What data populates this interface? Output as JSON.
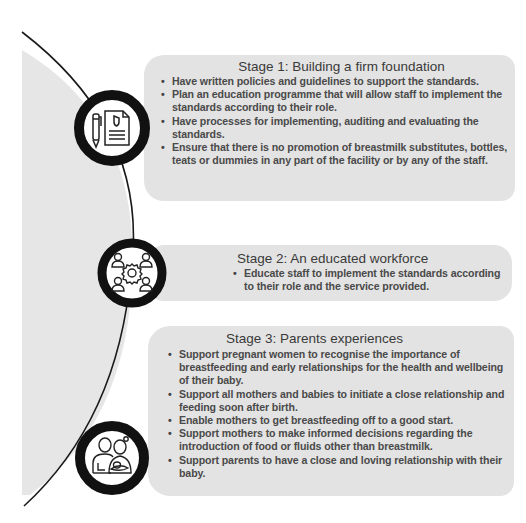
{
  "diagram": {
    "stages": [
      {
        "title": "Stage 1: Building a firm foundation",
        "icon": "document-pen-icon",
        "bullets": [
          "Have written policies and guidelines to support the standards.",
          "Plan an education programme that will allow staff to implement the standards according to their role.",
          "Have processes for implementing, auditing and evaluating the standards.",
          "Ensure that there is no promotion of breastmilk substitutes, bottles, teats or dummies in any part of the facility or by any of the staff."
        ]
      },
      {
        "title": "Stage 2: An educated workforce",
        "icon": "team-gear-icon",
        "bullets": [
          "Educate staff to implement the standards according to their role and the service provided."
        ]
      },
      {
        "title": "Stage 3: Parents experiences",
        "icon": "parents-baby-icon",
        "bullets": [
          "Support pregnant women to recognise the importance of breastfeeding and early relationships for the health and wellbeing of their baby.",
          "Support all mothers and babies to initiate a close relationship and feeding soon after birth.",
          "Enable mothers to get breastfeeding off to a good start.",
          "Support mothers to make informed decisions regarding the introduction of food or fluids other than breastmilk.",
          "Support parents to have a close and loving relationship with their baby."
        ]
      }
    ],
    "colors": {
      "panel": "#e3e3e3",
      "left_region": "#e6e6e6",
      "ring": "#111111",
      "text": "#4a4a4a"
    }
  }
}
